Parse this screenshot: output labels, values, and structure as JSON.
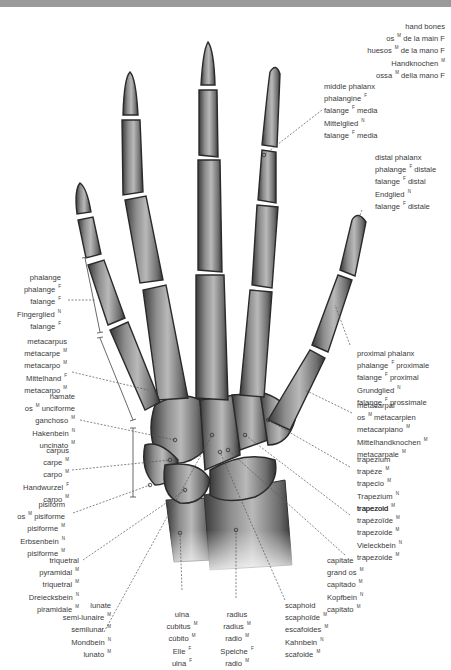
{
  "title_block": {
    "lines": [
      "hand bones",
      "os M de la main F",
      "huesos M de la mano F",
      "Handknochen M",
      "ossa M della mano F"
    ]
  },
  "labels": {
    "middle_phalanx": [
      "middle phalanx",
      "phalangine F",
      "falange F media",
      "Mittelglied N",
      "falange F media"
    ],
    "distal_phalanx": [
      "distal phalanx",
      "phalange F distale",
      "falange F distal",
      "Endglied N",
      "falange F distale"
    ],
    "phalange": [
      "phalange",
      "phalange F",
      "falange F",
      "Fingerglied N",
      "falange F"
    ],
    "metacarpus": [
      "metacarpus",
      "métacarpe M",
      "metacarpo M",
      "Mittelhand F",
      "metacarpo M"
    ],
    "proximal_phalanx": [
      "proximal phalanx",
      "phalange F proximale",
      "falange F proximal",
      "Grundglied N",
      "falange F prossimale"
    ],
    "hamate": [
      "hamate",
      "os M unciforme",
      "ganchoso M",
      "Hakenbein N",
      "uncinato M"
    ],
    "metacarpal": [
      "metacarpal",
      "os M métacarpien",
      "metacarpiano M",
      "Mittelhandknochen M",
      "metacarpale M"
    ],
    "carpus": [
      "carpus",
      "carpe M",
      "carpo M",
      "Handwurzel F",
      "carpo M"
    ],
    "trapezium": [
      "trapezium",
      "trapèze M",
      "trapecio M",
      "Trapezium N",
      "trapezoid M"
    ],
    "pisiform": [
      "pisiform",
      "os M pisiforme",
      "pisiforme M",
      "Erbsenbein N",
      "pisiforme M"
    ],
    "trapezoid": [
      "trapezoid",
      "trapézoïde M",
      "trapezoide M",
      "Vieleckbein N",
      "trapezoide M"
    ],
    "triquetral": [
      "triquetral",
      "pyramidal M",
      "triquetral M",
      "Dreiecksbein N",
      "piramidale M"
    ],
    "capitate": [
      "capitate",
      "grand os M",
      "capitado M",
      "Kopfbein N",
      "capitato M"
    ],
    "lunate": [
      "lunate",
      "semi-lunaire M",
      "semilunar M",
      "Mondbein N",
      "lunato M"
    ],
    "ulna": [
      "ulna",
      "cubitus M",
      "cúbito M",
      "Elle F",
      "ulna F"
    ],
    "radius": [
      "radius",
      "radius M",
      "radio M",
      "Speiche F",
      "radio M"
    ],
    "scaphoid": [
      "scaphoid",
      "scaphoïde M",
      "escafoides M",
      "Kahnbein N",
      "scafoide M"
    ]
  },
  "colors": {
    "top_bar": "#9a9a9a",
    "bone_light": "#b8b8b8",
    "bone_dark": "#3c3c3c",
    "text": "#3a3a3a",
    "leader": "#555555"
  }
}
